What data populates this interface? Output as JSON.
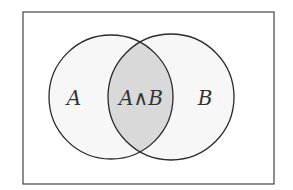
{
  "diagram": {
    "type": "venn",
    "sets": [
      {
        "label": "A",
        "fill": "#f7f7f7"
      },
      {
        "label": "B",
        "fill": "#f7f7f7"
      }
    ],
    "intersection": {
      "label": "A∧B",
      "fill": "#d9d9d9"
    },
    "stroke": "#2a2a2a",
    "frame_stroke": "#444444"
  }
}
